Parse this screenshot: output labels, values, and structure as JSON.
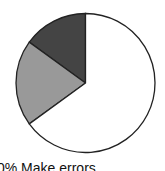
{
  "chart_data": {
    "type": "pie",
    "title": "",
    "start_angle": "12 o'clock, counterclockwise",
    "slices": [
      {
        "label": "Make errors",
        "value": 15,
        "color": "#444444"
      },
      {
        "label": "",
        "value": 20,
        "color": "#999999"
      },
      {
        "label": "",
        "value": 65,
        "color": "#ffffff"
      }
    ],
    "annotations": [
      "% Make errors"
    ]
  },
  "caption": "0% Make errors",
  "colors": {
    "outline": "#222222"
  }
}
